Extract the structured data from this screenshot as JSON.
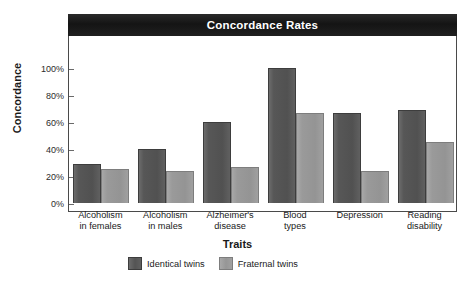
{
  "chart_data": {
    "type": "bar",
    "title": "Concordance Rates",
    "xlabel": "Traits",
    "ylabel": "Concordance",
    "ylim": [
      0,
      100
    ],
    "yticks": [
      "0%",
      "20%",
      "40%",
      "60%",
      "80%",
      "100%"
    ],
    "ytick_values": [
      0,
      20,
      40,
      60,
      80,
      100
    ],
    "grid": false,
    "legend_position": "bottom-left",
    "categories": [
      "Alcoholism\nin females",
      "Alcoholism\nin males",
      "Alzheimer's\ndisease",
      "Blood\ntypes",
      "Depression",
      "Reading\ndisability"
    ],
    "series": [
      {
        "name": "Identical twins",
        "color": "#555555",
        "values": [
          29,
          40,
          60,
          100,
          67,
          69
        ]
      },
      {
        "name": "Fraternal twins",
        "color": "#999999",
        "values": [
          25,
          24,
          27,
          67,
          24,
          45
        ]
      }
    ]
  },
  "legend": {
    "items": [
      {
        "label": "Identical twins",
        "swatch": "identical-twins-swatch"
      },
      {
        "label": "Fraternal twins",
        "swatch": "fraternal-twins-swatch"
      }
    ]
  },
  "colors": {
    "title_bar_background": "#141414",
    "title_text": "#ffffff",
    "axis_line": "#4a4a4a",
    "identical_bar": "#555555",
    "fraternal_bar": "#999999",
    "plot_background": "#ffffff"
  }
}
